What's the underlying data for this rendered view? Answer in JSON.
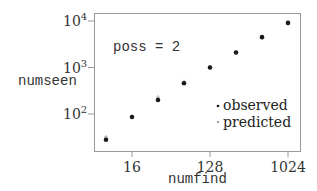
{
  "chart_data": {
    "type": "scatter",
    "title": "",
    "annotation": "poss = 2",
    "xlabel": "numfind",
    "ylabel": "numseen",
    "xscale": "log2",
    "yscale": "log10",
    "xticks": [
      "16",
      "128",
      "1024"
    ],
    "yticks": [
      {
        "base": "10",
        "exp": "2"
      },
      {
        "base": "10",
        "exp": "3"
      },
      {
        "base": "10",
        "exp": "4"
      }
    ],
    "x": [
      8,
      16,
      32,
      64,
      128,
      256,
      512,
      1024
    ],
    "series": [
      {
        "name": "observed",
        "marker": "dot",
        "color": "#1a1a1a",
        "values": [
          28,
          86,
          200,
          460,
          1000,
          2100,
          4500,
          9100
        ]
      },
      {
        "name": "predicted",
        "marker": "plus",
        "color": "#999999",
        "values": [
          32,
          88,
          230,
          500,
          1000,
          2100,
          4400,
          9000
        ]
      }
    ],
    "legend": {
      "position": "lower-right",
      "entries": [
        "observed",
        "predicted"
      ]
    },
    "grid": false
  }
}
